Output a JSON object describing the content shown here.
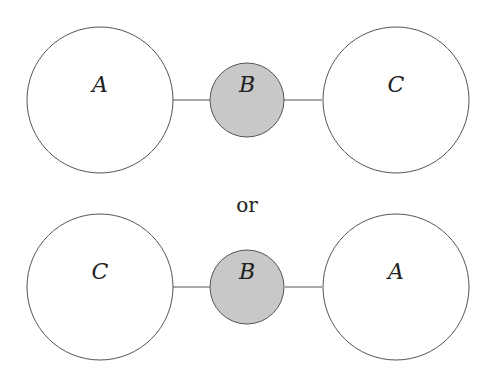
{
  "colors": {
    "stroke": "#555555",
    "small_fill": "#c8c8c8",
    "large_fill": "#ffffff"
  },
  "diagrams": [
    {
      "left": "A",
      "middle": "B",
      "right": "C"
    },
    {
      "left": "C",
      "middle": "B",
      "right": "A"
    }
  ],
  "separator": "or"
}
